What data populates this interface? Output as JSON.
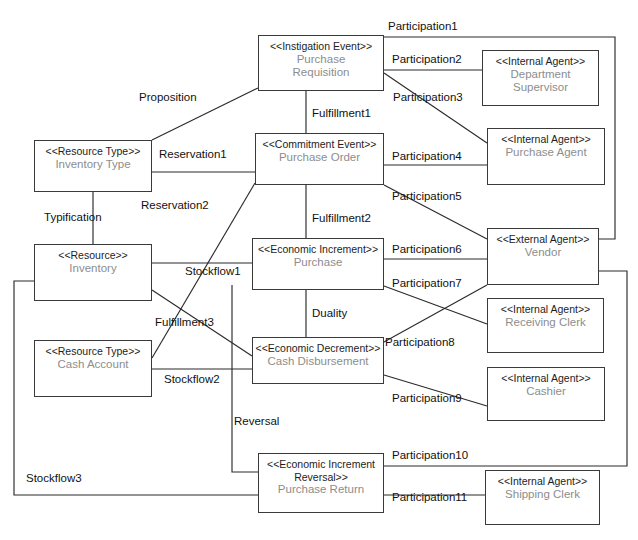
{
  "diagram": {
    "width": 638,
    "height": 540,
    "line_color": "#2b2b2b",
    "box_border_color": "#3a3a3a",
    "stereotype_color": "#1d1d1d",
    "name_color": "#8d8d8d",
    "background": "#ffffff"
  },
  "nodes": [
    {
      "id": "purchase-requisition",
      "stereotype": "<<Instigation Event>>",
      "name": "Purchase\nRequisition",
      "x": 258,
      "y": 35,
      "w": 126,
      "h": 56
    },
    {
      "id": "department-supervisor",
      "stereotype": "<<Internal Agent>>",
      "name": "Department\nSupervisor",
      "x": 482,
      "y": 50,
      "w": 117,
      "h": 56
    },
    {
      "id": "inventory-type",
      "stereotype": "<<Resource Type>>",
      "name": "Inventory Type",
      "x": 34,
      "y": 140,
      "w": 118,
      "h": 52
    },
    {
      "id": "purchase-order",
      "stereotype": "<<Commitment Event>>",
      "name": "Purchase Order",
      "x": 255,
      "y": 133,
      "w": 129,
      "h": 52
    },
    {
      "id": "purchase-agent",
      "stereotype": "<<Internal Agent>>",
      "name": "Purchase Agent",
      "x": 487,
      "y": 128,
      "w": 118,
      "h": 57
    },
    {
      "id": "inventory",
      "stereotype": "<<Resource>>",
      "name": "Inventory",
      "x": 34,
      "y": 244,
      "w": 118,
      "h": 57
    },
    {
      "id": "purchase",
      "stereotype": "<<Economic Increment>>",
      "name": "Purchase",
      "x": 252,
      "y": 238,
      "w": 132,
      "h": 52
    },
    {
      "id": "vendor",
      "stereotype": "<<External Agent>>",
      "name": "Vendor",
      "x": 487,
      "y": 228,
      "w": 112,
      "h": 57
    },
    {
      "id": "receiving-clerk",
      "stereotype": "<<Internal Agent>>",
      "name": "Receiving Clerk",
      "x": 487,
      "y": 298,
      "w": 117,
      "h": 55
    },
    {
      "id": "cash-account",
      "stereotype": "<<Resource Type>>",
      "name": "Cash Account",
      "x": 34,
      "y": 340,
      "w": 118,
      "h": 57
    },
    {
      "id": "cash-disbursement",
      "stereotype": "<<Economic Decrement>>",
      "name": "Cash Disbursement",
      "x": 252,
      "y": 337,
      "w": 132,
      "h": 47
    },
    {
      "id": "cashier",
      "stereotype": "<<Internal Agent>>",
      "name": "Cashier",
      "x": 487,
      "y": 367,
      "w": 118,
      "h": 54
    },
    {
      "id": "purchase-return",
      "stereotype": "<<Economic Increment\nReversal>>",
      "name": "Purchase Return",
      "x": 258,
      "y": 453,
      "w": 126,
      "h": 60
    },
    {
      "id": "shipping-clerk",
      "stereotype": "<<Internal Agent>>",
      "name": "Shipping Clerk",
      "x": 485,
      "y": 470,
      "w": 115,
      "h": 55
    }
  ],
  "edge_labels": [
    {
      "id": "participation1",
      "text": "Participation1",
      "x": 388,
      "y": 20
    },
    {
      "id": "participation2",
      "text": "Participation2",
      "x": 392,
      "y": 53
    },
    {
      "id": "proposition",
      "text": "Proposition",
      "x": 139,
      "y": 91
    },
    {
      "id": "participation3",
      "text": "Participation3",
      "x": 393,
      "y": 91
    },
    {
      "id": "fulfillment1",
      "text": "Fulfillment1",
      "x": 312,
      "y": 107
    },
    {
      "id": "reservation1",
      "text": "Reservation1",
      "x": 159,
      "y": 148
    },
    {
      "id": "participation4",
      "text": "Participation4",
      "x": 392,
      "y": 150
    },
    {
      "id": "participation5",
      "text": "Participation5",
      "x": 392,
      "y": 190
    },
    {
      "id": "reservation2",
      "text": "Reservation2",
      "x": 141,
      "y": 199
    },
    {
      "id": "typification",
      "text": "Typification",
      "x": 44,
      "y": 211
    },
    {
      "id": "fulfillment2",
      "text": "Fulfillment2",
      "x": 312,
      "y": 212
    },
    {
      "id": "participation6",
      "text": "Participation6",
      "x": 392,
      "y": 243
    },
    {
      "id": "stockflow1",
      "text": "Stockflow1",
      "x": 185,
      "y": 265
    },
    {
      "id": "participation7",
      "text": "Participation7",
      "x": 392,
      "y": 277
    },
    {
      "id": "fulfillment3",
      "text": "Fulfillment3",
      "x": 155,
      "y": 316
    },
    {
      "id": "duality",
      "text": "Duality",
      "x": 312,
      "y": 307
    },
    {
      "id": "participation8",
      "text": "Participation8",
      "x": 385,
      "y": 336
    },
    {
      "id": "stockflow2",
      "text": "Stockflow2",
      "x": 164,
      "y": 373
    },
    {
      "id": "participation9",
      "text": "Participation9",
      "x": 392,
      "y": 392
    },
    {
      "id": "reversal",
      "text": "Reversal",
      "x": 234,
      "y": 415
    },
    {
      "id": "participation10",
      "text": "Participation10",
      "x": 392,
      "y": 449
    },
    {
      "id": "stockflow3",
      "text": "Stockflow3",
      "x": 26,
      "y": 472
    },
    {
      "id": "participation11",
      "text": "Participation11",
      "x": 392,
      "y": 491
    }
  ],
  "edges": [
    {
      "id": "edge-participation1",
      "label": "Participation1",
      "from": "purchase-requisition",
      "to": "vendor",
      "points": "384,37 615,37 615,239 599,239"
    },
    {
      "id": "edge-participation2",
      "label": "Participation2",
      "from": "purchase-requisition",
      "to": "department-supervisor",
      "points": "384,70 482,70"
    },
    {
      "id": "edge-proposition",
      "label": "Proposition",
      "from": "inventory-type",
      "to": "purchase-requisition",
      "points": "152,140 258,88"
    },
    {
      "id": "edge-participation3",
      "label": "Participation3",
      "from": "purchase-requisition",
      "to": "purchase-agent",
      "points": "384,73 487,143"
    },
    {
      "id": "edge-fulfillment1",
      "label": "Fulfillment1",
      "from": "purchase-requisition",
      "to": "purchase-order",
      "points": "306,91 306,133"
    },
    {
      "id": "edge-reservation1",
      "label": "Reservation1",
      "from": "inventory-type",
      "to": "purchase-order",
      "points": "152,172 255,172"
    },
    {
      "id": "edge-participation4",
      "label": "Participation4",
      "from": "purchase-order",
      "to": "purchase-agent",
      "points": "384,165 487,165"
    },
    {
      "id": "edge-participation5",
      "label": "Participation5",
      "from": "purchase-order",
      "to": "vendor",
      "points": "384,185 487,239"
    },
    {
      "id": "edge-reservation2",
      "label": "Reservation2",
      "from": "cash-account",
      "to": "purchase-order",
      "points": "152,358 255,183"
    },
    {
      "id": "edge-typification",
      "label": "Typification",
      "from": "inventory-type",
      "to": "inventory",
      "points": "93,192 93,244"
    },
    {
      "id": "edge-fulfillment2",
      "label": "Fulfillment2",
      "from": "purchase-order",
      "to": "purchase",
      "points": "306,185 306,238"
    },
    {
      "id": "edge-participation6",
      "label": "Participation6",
      "from": "purchase",
      "to": "vendor",
      "points": "384,259 487,259"
    },
    {
      "id": "edge-stockflow1",
      "label": "Stockflow1",
      "from": "inventory",
      "to": "purchase",
      "points": "152,263 252,263"
    },
    {
      "id": "edge-participation7",
      "label": "Participation7",
      "from": "purchase",
      "to": "receiving-clerk",
      "points": "384,286 487,324"
    },
    {
      "id": "edge-fulfillment3",
      "label": "Fulfillment3",
      "from": "inventory",
      "to": "cash-disbursement",
      "points": "152,290 252,356"
    },
    {
      "id": "edge-duality",
      "label": "Duality",
      "from": "purchase",
      "to": "cash-disbursement",
      "points": "306,290 306,337"
    },
    {
      "id": "edge-participation8",
      "label": "Participation8",
      "from": "cash-disbursement",
      "to": "vendor",
      "points": "384,342 487,285"
    },
    {
      "id": "edge-stockflow2",
      "label": "Stockflow2",
      "from": "cash-account",
      "to": "cash-disbursement",
      "points": "152,369 252,369"
    },
    {
      "id": "edge-participation9",
      "label": "Participation9",
      "from": "cash-disbursement",
      "to": "cashier",
      "points": "384,375 487,406"
    },
    {
      "id": "edge-reversal",
      "label": "Reversal",
      "from": "purchase",
      "to": "purchase-return",
      "points": "232,285 232,472 258,472"
    },
    {
      "id": "edge-participation10",
      "label": "Participation10",
      "from": "purchase-return",
      "to": "vendor",
      "points": "384,466 627,466 627,271 599,271"
    },
    {
      "id": "edge-stockflow3",
      "label": "Stockflow3",
      "from": "inventory",
      "to": "purchase-return",
      "points": "34,281 14,281 14,495 258,495"
    },
    {
      "id": "edge-participation11",
      "label": "Participation11",
      "from": "purchase-return",
      "to": "shipping-clerk",
      "points": "384,495 485,495"
    }
  ]
}
